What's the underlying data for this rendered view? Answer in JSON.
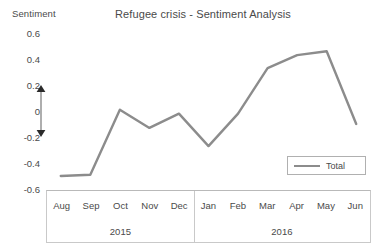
{
  "chart_data": {
    "type": "line",
    "title": "Refugee crisis - Sentiment Analysis",
    "xlabel": "",
    "ylabel": "Sentiment",
    "ylim": [
      -0.6,
      0.6
    ],
    "ytick_labels": [
      "0.6",
      "0.4",
      "0.2",
      "0",
      "-0.2",
      "-0.4",
      "-0.6"
    ],
    "ytick_values": [
      0.6,
      0.4,
      0.2,
      0,
      -0.2,
      -0.4,
      -0.6
    ],
    "grid": false,
    "legend_position": "bottom-right",
    "categories": [
      "Aug",
      "Sep",
      "Oct",
      "Nov",
      "Dec",
      "Jan",
      "Feb",
      "Mar",
      "Apr",
      "May",
      "Jun"
    ],
    "group_labels": [
      "2015",
      "2016"
    ],
    "group_spans": [
      5,
      6
    ],
    "series": [
      {
        "name": "Total",
        "color": "#8c8c8c",
        "values": [
          -0.5,
          -0.49,
          0.01,
          -0.13,
          -0.02,
          -0.27,
          -0.02,
          0.33,
          0.43,
          0.46,
          -0.1
        ]
      }
    ],
    "annotations": [
      {
        "name": "neutral-range-arrow",
        "type": "double-headed-arrow",
        "from": 0.2,
        "to": -0.2,
        "color": "#9a9a9a"
      }
    ]
  },
  "legend": {
    "items": [
      {
        "label": "Total"
      }
    ]
  }
}
